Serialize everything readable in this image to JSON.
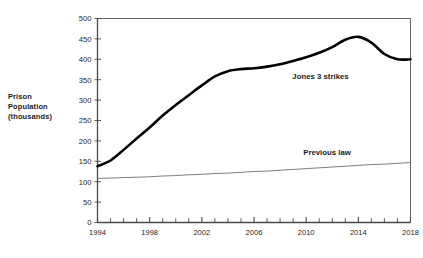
{
  "axis_title_lines": [
    "Prison",
    "Population",
    "(thousands)"
  ],
  "colors": {
    "background": "#ffffff",
    "thick_series": "#000000",
    "thin_series": "#6e6e6e",
    "axis": "#4a4a4a",
    "frame": "#555555",
    "text": "#262626"
  },
  "chart_data": {
    "type": "line",
    "title": "",
    "subtitle": "",
    "xlabel": "",
    "ylabel": "Prison Population (thousands)",
    "xlim": [
      1994,
      2018
    ],
    "ylim": [
      0,
      500
    ],
    "ytick_step": 50,
    "xtick_step": 1,
    "xlabel_step": 4,
    "grid": false,
    "legend_position": "inline-annotation",
    "ytick_labels": [
      "0",
      "50",
      "100",
      "150",
      "200",
      "250",
      "300",
      "350",
      "400",
      "450",
      "500"
    ],
    "ytick_values": [
      0,
      50,
      100,
      150,
      200,
      250,
      300,
      350,
      400,
      450,
      500
    ],
    "xtick_values": [
      1994,
      1995,
      1996,
      1997,
      1998,
      1999,
      2000,
      2001,
      2002,
      2003,
      2004,
      2005,
      2006,
      2007,
      2008,
      2009,
      2010,
      2011,
      2012,
      2013,
      2014,
      2015,
      2016,
      2017,
      2018
    ],
    "xtick_labels": [
      "1994",
      "",
      "",
      "",
      "1998",
      "",
      "",
      "",
      "2002",
      "",
      "",
      "",
      "2006",
      "",
      "",
      "",
      "2010",
      "",
      "",
      "",
      "2014",
      "",
      "",
      "",
      "2018"
    ],
    "x": [
      1994,
      1995,
      1996,
      1997,
      1998,
      1999,
      2000,
      2001,
      2002,
      2003,
      2004,
      2005,
      2006,
      2007,
      2008,
      2009,
      2010,
      2011,
      2012,
      2013,
      2014,
      2015,
      2016,
      2017,
      2018
    ],
    "series": [
      {
        "name": "Jones 3 strikes",
        "label_x": 2011.1,
        "label_y": 352,
        "style": "thick",
        "values": [
          138,
          152,
          178,
          206,
          233,
          262,
          288,
          312,
          336,
          358,
          371,
          376,
          378,
          382,
          388,
          396,
          405,
          416,
          430,
          448,
          455,
          441,
          413,
          400,
          400
        ]
      },
      {
        "name": "Previous law",
        "label_x": 2011.6,
        "label_y": 166,
        "style": "thin",
        "values": [
          108,
          109,
          110,
          111,
          112,
          114,
          115,
          117,
          118,
          120,
          121,
          123,
          125,
          126,
          128,
          130,
          132,
          134,
          136,
          138,
          140,
          142,
          143,
          145,
          147
        ]
      }
    ]
  }
}
